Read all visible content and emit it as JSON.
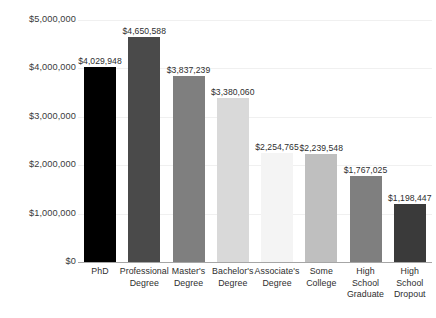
{
  "chart_data": {
    "type": "bar",
    "title": "",
    "subtitle": "",
    "xlabel": "",
    "ylabel": "",
    "ylim": [
      0,
      5000000
    ],
    "grid": true,
    "legend": false,
    "categories": [
      "PhD",
      "Professional Degree",
      "Master's Degree",
      "Bachelor's Degree",
      "Associate's Degree",
      "Some College",
      "High School Graduate",
      "High School Dropout"
    ],
    "category_lines": [
      [
        "PhD"
      ],
      [
        "Professional",
        "Degree"
      ],
      [
        "Master's",
        "Degree"
      ],
      [
        "Bachelor's",
        "Degree"
      ],
      [
        "Associate's",
        "Degree"
      ],
      [
        "Some",
        "College"
      ],
      [
        "High",
        "School",
        "Graduate"
      ],
      [
        "High",
        "School",
        "Dropout"
      ]
    ],
    "values": [
      4029948,
      4650588,
      3837239,
      3380060,
      2254765,
      2239548,
      1767025,
      1198447
    ],
    "value_labels": [
      "$4,029,948",
      "$4,650,588",
      "$3,837,239",
      "$3,380,060",
      "$2,254,765",
      "$2,239,548",
      "$1,767,025",
      "$1,198,447"
    ],
    "bar_colors": [
      "#000000",
      "#4a4a4a",
      "#7f7f7f",
      "#d9d9d9",
      "#f4f4f4",
      "#bfbfbf",
      "#7f7f7f",
      "#3a3a3a"
    ],
    "y_ticks": [
      0,
      1000000,
      2000000,
      3000000,
      4000000,
      5000000
    ],
    "y_tick_labels": [
      "$0",
      "$1,000,000",
      "$2,000,000",
      "$3,000,000",
      "$4,000,000",
      "$5,000,000"
    ],
    "colors": {
      "background": "#ffffff",
      "gridline": "#f0f0f0",
      "axis_line": "#a6a6a6",
      "text": "#2e2e2e"
    }
  }
}
